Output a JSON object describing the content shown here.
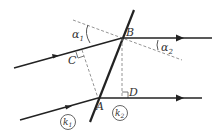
{
  "diagram": {
    "type": "refraction-wavefront",
    "colors": {
      "line": "#222222",
      "dashed": "#888888",
      "text": "#333333"
    },
    "points": {
      "A": {
        "label": "A",
        "x": 98,
        "y": 98
      },
      "B": {
        "label": "B",
        "x": 122,
        "y": 38
      },
      "C": {
        "label": "C",
        "x": 82,
        "y": 50
      },
      "D": {
        "label": "D",
        "x": 122,
        "y": 98
      }
    },
    "angles": [
      {
        "label": "α",
        "sub": "1"
      },
      {
        "label": "α",
        "sub": "2"
      }
    ],
    "regions": [
      {
        "label": "k",
        "sub": "1"
      },
      {
        "label": "k",
        "sub": "2"
      }
    ]
  }
}
